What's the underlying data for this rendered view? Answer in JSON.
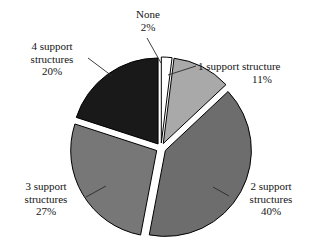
{
  "chart_data": {
    "type": "pie",
    "title": "",
    "subtitle": "",
    "xlabel": "",
    "ylabel": "",
    "legend_position": "none",
    "grid": false,
    "exploded": true,
    "start_angle_deg": 0,
    "direction": "clockwise",
    "units": "percent",
    "categories": [
      "None",
      "1 support structure",
      "2 support structures",
      "3 support structures",
      "4 support structures"
    ],
    "values": [
      2,
      11,
      40,
      27,
      20
    ],
    "slices": [
      {
        "label": "None",
        "label_line1": "None",
        "label_line2": "2%",
        "value": 2,
        "value_text": "2%",
        "color": "#ffffff"
      },
      {
        "label": "1 support structure",
        "label_line1": "1 support structure",
        "label_line2": "11%",
        "value": 11,
        "value_text": "11%",
        "color": "#a9a9a9"
      },
      {
        "label": "2 support structures",
        "label_line1": "2 support",
        "label_line2": "structures",
        "label_line3": "40%",
        "value": 40,
        "value_text": "40%",
        "color": "#6d6d6d"
      },
      {
        "label": "3 support structures",
        "label_line1": "3 support",
        "label_line2": "structures",
        "label_line3": "27%",
        "value": 27,
        "value_text": "27%",
        "color": "#777777"
      },
      {
        "label": "4 support structures",
        "label_line1": "4 support",
        "label_line2": "structures",
        "label_line3": "20%",
        "value": 20,
        "value_text": "20%",
        "color": "#191919"
      }
    ]
  },
  "colors": {
    "background": "#ffffff",
    "text": "#141414",
    "outline": "#000000",
    "slice_none": "#ffffff",
    "slice_one": "#a9a9a9",
    "slice_two": "#6d6d6d",
    "slice_three": "#777777",
    "slice_four": "#191919"
  }
}
